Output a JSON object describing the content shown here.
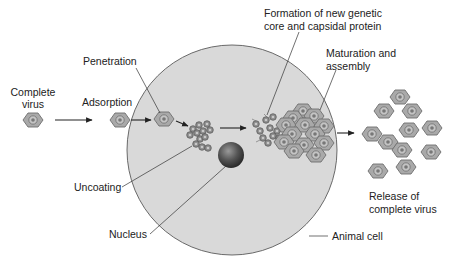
{
  "diagram": {
    "labels": {
      "complete_virus_line1": "Complete",
      "complete_virus_line2": "virus",
      "adsorption": "Adsorption",
      "penetration": "Penetration",
      "uncoating": "Uncoating",
      "nucleus": "Nucleus",
      "formation_line1": "Formation of new genetic",
      "formation_line2": "core and capsidal protein",
      "maturation_line1": "Maturation and",
      "maturation_line2": "assembly",
      "release_line1": "Release of",
      "release_line2": "complete virus",
      "animal_cell": "Animal cell"
    },
    "stages": [
      "Complete virus",
      "Adsorption",
      "Penetration",
      "Uncoating",
      "Formation of new genetic core and capsidal protein",
      "Maturation and assembly",
      "Release of complete virus"
    ],
    "icons": {
      "virus": "hexagon-virus-icon",
      "nucleus": "sphere-nucleus-icon",
      "genetic_core": "circle-core-icon",
      "arrow": "right-arrow-icon"
    },
    "colors": {
      "cell_fill": "#d9d9d9",
      "cell_stroke": "#5a5a5a",
      "virus_fill": "#a9a9a9",
      "virus_stroke": "#6e6e6e",
      "nucleus": "#4a4a4a",
      "text": "#222222"
    }
  }
}
